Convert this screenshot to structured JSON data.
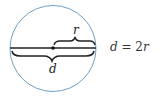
{
  "diagram": {
    "circle": {
      "cx": 53,
      "cy": 48.5,
      "r": 43,
      "stroke": "#6fa0c8"
    },
    "diameter_line": {
      "x1": 10,
      "x2": 96,
      "y": 48,
      "stroke": "#222222"
    },
    "center_point": {
      "x": 53,
      "y": 48
    },
    "labels": {
      "radius": "r",
      "diameter": "d"
    },
    "equation": {
      "lhs": "d",
      "op": " = 2",
      "rhs": "r"
    }
  }
}
